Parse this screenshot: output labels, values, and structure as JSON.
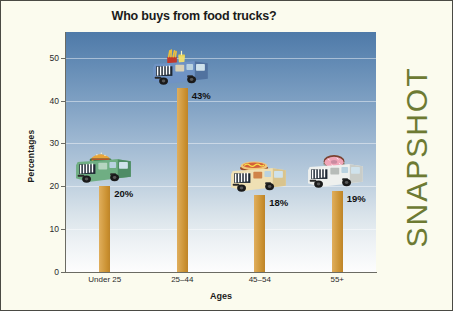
{
  "page": {
    "background_color": "#fbfbee",
    "border_color": "#4a4a44",
    "side_label": "SNAPSHOT",
    "side_label_color": "#6d7a33"
  },
  "chart_data": {
    "type": "bar",
    "title": "Who buys from food trucks?",
    "xlabel": "Ages",
    "ylabel": "Percentages",
    "categories": [
      "Under 25",
      "25–44",
      "45–54",
      "55+"
    ],
    "values": [
      20,
      43,
      18,
      19
    ],
    "value_labels": [
      "20%",
      "43%",
      "18%",
      "19%"
    ],
    "ylim": [
      0,
      56
    ],
    "yticks": [
      0,
      10,
      20,
      30,
      40,
      50
    ],
    "ytick_labels": [
      "0",
      "10",
      "20",
      "30",
      "40",
      "50"
    ],
    "grid": true,
    "legend": "none",
    "bar_color": "#d09a3c",
    "plot_background": "blue-to-white vertical gradient",
    "annotations": [
      {
        "category": "Under 25",
        "icon": "green-food-truck-with-hamburger"
      },
      {
        "category": "25–44",
        "icon": "blue-food-truck-with-fries-and-drink"
      },
      {
        "category": "45–54",
        "icon": "cream-food-truck-with-hot-dog"
      },
      {
        "category": "55+",
        "icon": "white-food-truck-with-donut"
      }
    ]
  }
}
